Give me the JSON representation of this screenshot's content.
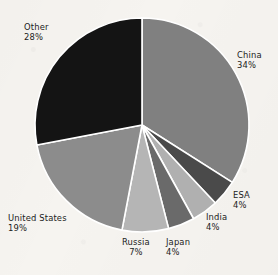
{
  "chart_data": {
    "type": "pie",
    "title": "",
    "subtitle": "",
    "xlabel": "",
    "ylabel": "",
    "legend_position": "none",
    "grid": false,
    "units": "percent",
    "start_angle_deg": 0,
    "direction": "clockwise",
    "categories": [
      "China",
      "ESA",
      "India",
      "Japan",
      "Russia",
      "United States",
      "Other"
    ],
    "values": [
      34,
      4,
      4,
      4,
      7,
      19,
      28
    ],
    "slices": [
      {
        "label": "China",
        "value": 34,
        "pct_text": "34%",
        "color": "#808080"
      },
      {
        "label": "ESA",
        "value": 4,
        "pct_text": "4%",
        "color": "#4a4a4a"
      },
      {
        "label": "India",
        "value": 4,
        "pct_text": "4%",
        "color": "#b0b0b0"
      },
      {
        "label": "Japan",
        "value": 4,
        "pct_text": "4%",
        "color": "#6a6a6a"
      },
      {
        "label": "Russia",
        "value": 7,
        "pct_text": "7%",
        "color": "#b5b5b5"
      },
      {
        "label": "United States",
        "value": 19,
        "pct_text": "19%",
        "color": "#8c8c8c"
      },
      {
        "label": "Other",
        "value": 28,
        "pct_text": "28%",
        "color": "#141414"
      }
    ]
  },
  "labels": {
    "china": {
      "name": "China",
      "pct": "34%"
    },
    "esa": {
      "name": "ESA",
      "pct": "4%"
    },
    "india": {
      "name": "India",
      "pct": "4%"
    },
    "japan": {
      "name": "Japan",
      "pct": "4%"
    },
    "russia": {
      "name": "Russia",
      "pct": "7%"
    },
    "united_states": {
      "name": "United States",
      "pct": "19%"
    },
    "other": {
      "name": "Other",
      "pct": "28%"
    }
  },
  "style": {
    "background": "#f6f4f0",
    "separator_color": "#ffffff",
    "text_color": "#1b1b1b"
  },
  "geometry": {
    "center_x": 142,
    "center_y": 125,
    "radius": 107
  }
}
